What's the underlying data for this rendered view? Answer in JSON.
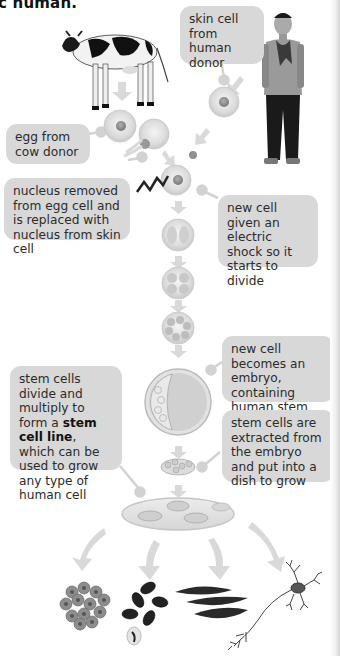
{
  "title": "c human.",
  "labels": {
    "skin_cell": "skin cell from human donor",
    "egg": "egg from cow donor",
    "nucleus": "nucleus removed from egg cell and is replaced with nucleus from skin cell",
    "shock": "new cell given an electric shock so it starts to divide",
    "embryo": "new cell becomes an embryo, containing human stem cells",
    "extracted": "stem cells are extracted from the embryo and put into a dish to grow",
    "stem_line_pre": "stem cells divide and multiply to form a ",
    "stem_line_bold": "stem cell line",
    "stem_line_post": ", which can be used to grow any type of human cell"
  },
  "figures": {
    "cow": "cow-image",
    "human": "human-donor-image",
    "output_cells": [
      "skin-cells",
      "red-blood-cells",
      "muscle-cells",
      "nerve-cell"
    ]
  },
  "colors": {
    "box_bg": "#d8d8d8",
    "connector": "#d0d0d0",
    "arrow": "#d9d9d9",
    "cell_fill": "#e3e3e3"
  }
}
